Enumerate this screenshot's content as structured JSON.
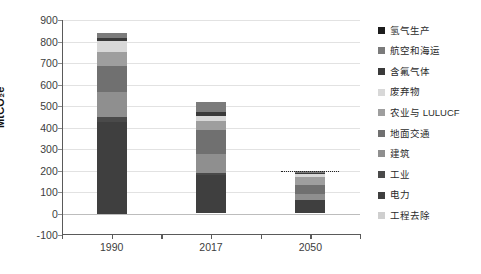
{
  "chart_data": {
    "type": "bar",
    "subtype": "stacked-bar",
    "title": "",
    "xlabel": "",
    "ylabel": "MtCO₂e",
    "categories": [
      "1990",
      "2017",
      "2050"
    ],
    "ylim": [
      -100,
      900
    ],
    "yticks": [
      -100,
      0,
      100,
      200,
      300,
      400,
      500,
      600,
      700,
      800,
      900
    ],
    "ytick_labels": [
      "-100",
      "0",
      "100",
      "200",
      "300",
      "400",
      "500",
      "600",
      "700",
      "800",
      "900"
    ],
    "grid": true,
    "legend_position": "right",
    "series": [
      {
        "name": "电力",
        "color": "#3f3f3f",
        "values": [
          425,
          178,
          62
        ]
      },
      {
        "name": "工业",
        "color": "#4a4a4a",
        "values": [
          22,
          10,
          0
        ]
      },
      {
        "name": "建筑",
        "color": "#8f8f8f",
        "values": [
          118,
          88,
          28
        ]
      },
      {
        "name": "地面交通",
        "color": "#707070",
        "values": [
          123,
          112,
          42
        ]
      },
      {
        "name": "农业与 LULUCF",
        "color": "#9e9e9e",
        "values": [
          62,
          42,
          36
        ]
      },
      {
        "name": "废弃物",
        "color": "#d8d8d8",
        "values": [
          52,
          24,
          14
        ]
      },
      {
        "name": "含氟气体",
        "color": "#3a3a3a",
        "values": [
          14,
          16,
          6
        ]
      },
      {
        "name": "航空和海运",
        "color": "#7b7b7b",
        "values": [
          24,
          50,
          12
        ]
      },
      {
        "name": "氢气生产",
        "color": "#1c1c1c",
        "values": [
          0,
          0,
          0
        ]
      },
      {
        "name": "工程去除",
        "color": "#cfcfcf",
        "values": [
          0,
          0,
          0
        ]
      }
    ],
    "totals": [
      840,
      520,
      200
    ],
    "annotations": [
      {
        "name": "net-zero-target-line",
        "category": "2050",
        "value": 200,
        "style": "dotted"
      }
    ]
  },
  "legend": {
    "items": [
      {
        "label": "氢气生产",
        "color": "#1c1c1c"
      },
      {
        "label": "航空和海运",
        "color": "#7b7b7b"
      },
      {
        "label": "含氟气体",
        "color": "#3a3a3a"
      },
      {
        "label": "废弃物",
        "color": "#d8d8d8"
      },
      {
        "label": "农业与 LULUCF",
        "color": "#9e9e9e"
      },
      {
        "label": "地面交通",
        "color": "#707070"
      },
      {
        "label": "建筑",
        "color": "#8f8f8f"
      },
      {
        "label": "工业",
        "color": "#4a4a4a"
      },
      {
        "label": "电力",
        "color": "#3f3f3f"
      },
      {
        "label": "工程去除",
        "color": "#cfcfcf"
      }
    ]
  },
  "axes": {
    "y_title": "MtCO₂e"
  },
  "colors": {
    "gridline": "#e2e2e2",
    "axis": "#5a5a5a",
    "background": "#ffffff",
    "text": "#3d3d3d"
  }
}
